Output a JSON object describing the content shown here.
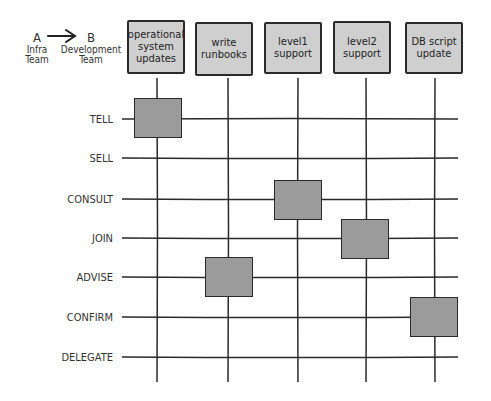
{
  "legend": {
    "from_letter": "A",
    "from_label_1": "Infra",
    "from_label_2": "Team",
    "to_letter": "B",
    "to_label_1": "Development",
    "to_label_2": "Team",
    "arrow": "arrow-right-icon"
  },
  "columns": [
    {
      "label": "operational system updates"
    },
    {
      "label": "write runbooks"
    },
    {
      "label": "level1 support"
    },
    {
      "label": "level2 support"
    },
    {
      "label": "DB script update"
    }
  ],
  "rows": [
    {
      "label": "TELL"
    },
    {
      "label": "SELL"
    },
    {
      "label": "CONSULT"
    },
    {
      "label": "JOIN"
    },
    {
      "label": "ADVISE"
    },
    {
      "label": "CONFIRM"
    },
    {
      "label": "DELEGATE"
    }
  ],
  "assignments": [
    {
      "column": "operational system updates",
      "row": "TELL"
    },
    {
      "column": "write runbooks",
      "row": "ADVISE"
    },
    {
      "column": "level1 support",
      "row": "CONSULT"
    },
    {
      "column": "level2 support",
      "row": "JOIN"
    },
    {
      "column": "DB script update",
      "row": "CONFIRM"
    }
  ],
  "colors": {
    "header_fill": "#cfcfcf",
    "cell_fill": "#9b9b9b",
    "line": "#2a2a2a"
  }
}
